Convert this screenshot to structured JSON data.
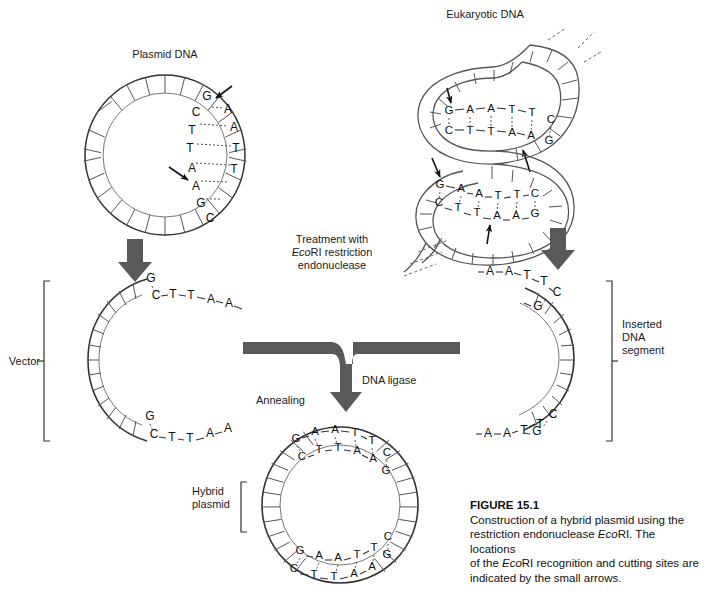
{
  "figure": {
    "number": "FIGURE 15.1",
    "caption_lines": [
      "Construction of a hybrid plasmid using the",
      "restriction endonuclease EcoRI. The locations",
      "of the EcoRI recognition and cutting sites are",
      "indicated by the small arrows."
    ],
    "caption_italic_term": "Eco",
    "caption_plain_term": "RI"
  },
  "labels": {
    "plasmid_dna": "Plasmid DNA",
    "eukaryotic_dna": "Eukaryotic DNA",
    "treatment_line1": "Treatment with",
    "treatment_line2_italic": "Eco",
    "treatment_line2_rest": "RI restriction",
    "treatment_line3": "endonuclease",
    "vector": "Vector",
    "inserted_line1": "Inserted",
    "inserted_line2": "DNA",
    "inserted_line3": "segment",
    "dna_ligase": "DNA ligase",
    "annealing": "Annealing",
    "hybrid_line1": "Hybrid",
    "hybrid_line2": "plasmid"
  },
  "sequences": {
    "recognition_site_top": "GAATTC",
    "recognition_site_bottom": "CTTAAG",
    "plasmid_inner_strand": [
      "G",
      "C",
      "T",
      "T",
      "A",
      "A",
      "G",
      "C"
    ],
    "plasmid_outer_strand": [
      "A",
      "A",
      "T",
      "T"
    ],
    "euk_top_site_upper": [
      "G",
      "A",
      "A",
      "T",
      "T",
      "C"
    ],
    "euk_top_site_lower": [
      "C",
      "T",
      "T",
      "A",
      "A",
      "G"
    ],
    "euk_bottom_site_upper": [
      "G",
      "A",
      "A",
      "T",
      "T",
      "C"
    ],
    "euk_bottom_site_lower": [
      "C",
      "T",
      "T",
      "A",
      "A",
      "G"
    ],
    "vector_top_sticky_upper": [
      "G"
    ],
    "vector_top_sticky_lower": [
      "C",
      "T",
      "T",
      "A",
      "A"
    ],
    "vector_bottom_sticky_upper": [
      "G"
    ],
    "vector_bottom_sticky_lower": [
      "C",
      "T",
      "T",
      "A",
      "A"
    ],
    "insert_top_sticky_upper": [
      "A",
      "A",
      "T",
      "T",
      "C"
    ],
    "insert_top_sticky_lower": [
      "G"
    ],
    "insert_bottom_sticky_upper": [
      "A",
      "A",
      "T",
      "T",
      "C"
    ],
    "insert_bottom_sticky_lower": [
      "G"
    ],
    "hybrid_top_upper": [
      "G",
      "A",
      "A",
      "T",
      "T",
      "C"
    ],
    "hybrid_top_lower": [
      "C",
      "T",
      "T",
      "A",
      "A",
      "G"
    ],
    "hybrid_bottom_upper": [
      "G",
      "A",
      "A",
      "T",
      "T",
      "C"
    ],
    "hybrid_bottom_lower": [
      "C",
      "T",
      "T",
      "A",
      "A",
      "G"
    ]
  },
  "colors": {
    "stroke": "#333333",
    "arrow_gray": "#595959",
    "text": "#1a1a1a",
    "background": "#ffffff"
  },
  "counts": {
    "small_arrows": 4,
    "thick_arrows": 3
  }
}
